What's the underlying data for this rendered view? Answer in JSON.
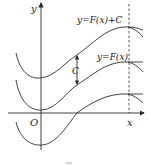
{
  "figure": {
    "axis_labels": {
      "x": "x",
      "y": "y",
      "origin": "O"
    },
    "curve_labels": {
      "shifted": "y=F(x)+C",
      "base": "y=F(x)"
    },
    "shift_label": "C",
    "caption_mark": "—"
  },
  "colors": {
    "stroke": "#2a2a2a",
    "background": "#ffffff"
  }
}
